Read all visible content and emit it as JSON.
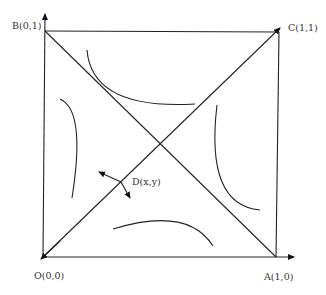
{
  "diagram": {
    "type": "unit-square geometry with hyperbolic contour curves",
    "points": {
      "O": {
        "label": "O(0,0)",
        "px": [
          43,
          257
        ]
      },
      "A": {
        "label": "A(1,0)",
        "px": [
          276,
          257
        ]
      },
      "B": {
        "label": "B(0,1)",
        "px": [
          45,
          31
        ]
      },
      "C": {
        "label": "C(1,1)",
        "px": [
          279,
          32
        ]
      },
      "D": {
        "label": "D(x,y)",
        "px": [
          121,
          182
        ]
      }
    },
    "segments": [
      "O-A",
      "O-B",
      "B-C",
      "C-A",
      "O-C (diagonal)",
      "B-A (diagonal)"
    ],
    "arrows": [
      "up from B",
      "C corner",
      "right from A",
      "at O",
      "two arrows through D"
    ],
    "curves": [
      "top (concave up)",
      "left (concave right)",
      "right (concave left)",
      "bottom (concave down)"
    ],
    "stroke_color": "#222222",
    "background": "#ffffff"
  }
}
